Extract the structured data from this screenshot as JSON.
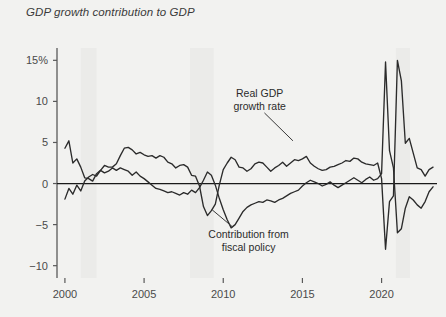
{
  "chart_data": {
    "type": "line",
    "title": "GDP growth contribution to GDP",
    "xlabel": "",
    "ylabel": "",
    "xlim": [
      1999.5,
      2023.5
    ],
    "ylim": [
      -11.5,
      16.5
    ],
    "grid": false,
    "legend_position": "inline-annotations",
    "y_ticks": [
      {
        "value": 15,
        "label": "15%"
      },
      {
        "value": 10,
        "label": "10"
      },
      {
        "value": 5,
        "label": "5"
      },
      {
        "value": 0,
        "label": "0"
      },
      {
        "value": -5,
        "label": "−5"
      },
      {
        "value": -10,
        "label": "−10"
      }
    ],
    "x_ticks": [
      {
        "value": 2000,
        "label": "2000"
      },
      {
        "value": 2005,
        "label": "2005"
      },
      {
        "value": 2010,
        "label": "2010"
      },
      {
        "value": 2015,
        "label": "2015"
      },
      {
        "value": 2020,
        "label": "2020"
      }
    ],
    "annotations": [
      {
        "name": "real-gdp-annotation",
        "line1": "Real GDP",
        "line2": "growth rate",
        "text_x": 2012.3,
        "text_y": 10.5,
        "leader_from": [
          2012.6,
          8.6
        ],
        "leader_to": [
          2014.4,
          5.2
        ]
      },
      {
        "name": "fiscal-policy-annotation",
        "line1": "Contribution from",
        "line2": "fiscal policy",
        "text_x": 2011.6,
        "text_y": -6.6,
        "leader_from": [
          2010.6,
          -5.3
        ],
        "leader_to": [
          2009.3,
          -3.2
        ]
      }
    ],
    "recession_bands": [
      {
        "name": "recession-2001",
        "start": 2001.0,
        "end": 2002.0
      },
      {
        "name": "recession-2008",
        "start": 2007.9,
        "end": 2009.4
      },
      {
        "name": "recession-2020",
        "start": 2020.9,
        "end": 2021.8
      }
    ],
    "band_color": "#ebebe9",
    "zero_line_color": "#1a1a1a",
    "axis_color": "#595959",
    "series": [
      {
        "name": "Real GDP growth rate",
        "color": "#2b2b2b",
        "x": [
          2000.0,
          2000.25,
          2000.5,
          2000.75,
          2001.0,
          2001.25,
          2001.5,
          2001.75,
          2002.0,
          2002.25,
          2002.5,
          2002.75,
          2003.0,
          2003.25,
          2003.5,
          2003.75,
          2004.0,
          2004.25,
          2004.5,
          2004.75,
          2005.0,
          2005.25,
          2005.5,
          2005.75,
          2006.0,
          2006.25,
          2006.5,
          2006.75,
          2007.0,
          2007.25,
          2007.5,
          2007.75,
          2008.0,
          2008.25,
          2008.5,
          2008.75,
          2009.0,
          2009.25,
          2009.5,
          2009.75,
          2010.0,
          2010.25,
          2010.5,
          2010.75,
          2011.0,
          2011.25,
          2011.5,
          2011.75,
          2012.0,
          2012.25,
          2012.5,
          2012.75,
          2013.0,
          2013.25,
          2013.5,
          2013.75,
          2014.0,
          2014.25,
          2014.5,
          2014.75,
          2015.0,
          2015.25,
          2015.5,
          2015.75,
          2016.0,
          2016.25,
          2016.5,
          2016.75,
          2017.0,
          2017.25,
          2017.5,
          2017.75,
          2018.0,
          2018.25,
          2018.5,
          2018.75,
          2019.0,
          2019.25,
          2019.5,
          2019.75,
          2020.0,
          2020.25,
          2020.5,
          2020.75,
          2021.0,
          2021.25,
          2021.5,
          2021.75,
          2022.0,
          2022.25,
          2022.5,
          2022.75,
          2023.0,
          2023.25
        ],
        "values": [
          4.3,
          5.2,
          2.5,
          3.0,
          2.0,
          0.7,
          0.6,
          0.3,
          1.2,
          1.6,
          2.2,
          2.0,
          2.0,
          2.4,
          3.4,
          4.3,
          4.4,
          4.1,
          3.6,
          3.8,
          3.5,
          3.3,
          3.4,
          3.1,
          3.4,
          3.2,
          2.6,
          2.4,
          1.9,
          2.2,
          2.3,
          2.0,
          1.0,
          0.9,
          -0.3,
          -2.8,
          -3.9,
          -3.3,
          -2.5,
          -0.2,
          1.7,
          2.5,
          3.2,
          2.9,
          2.0,
          1.9,
          1.5,
          1.8,
          2.4,
          2.6,
          2.5,
          2.0,
          1.5,
          1.9,
          2.2,
          2.6,
          2.1,
          2.5,
          2.9,
          2.8,
          3.0,
          3.3,
          2.5,
          2.1,
          1.8,
          1.6,
          1.7,
          2.0,
          2.1,
          2.3,
          2.5,
          2.8,
          2.7,
          3.1,
          3.0,
          2.6,
          2.4,
          2.3,
          2.2,
          2.5,
          0.6,
          -8.0,
          -2.2,
          -1.5,
          15.0,
          12.5,
          4.9,
          5.5,
          3.7,
          1.9,
          1.7,
          0.9,
          1.7,
          2.0
        ]
      },
      {
        "name": "Contribution from fiscal policy",
        "color": "#2b2b2b",
        "x": [
          2000.0,
          2000.25,
          2000.5,
          2000.75,
          2001.0,
          2001.25,
          2001.5,
          2001.75,
          2002.0,
          2002.25,
          2002.5,
          2002.75,
          2003.0,
          2003.25,
          2003.5,
          2003.75,
          2004.0,
          2004.25,
          2004.5,
          2004.75,
          2005.0,
          2005.25,
          2005.5,
          2005.75,
          2006.0,
          2006.25,
          2006.5,
          2006.75,
          2007.0,
          2007.25,
          2007.5,
          2007.75,
          2008.0,
          2008.25,
          2008.5,
          2008.75,
          2009.0,
          2009.25,
          2009.5,
          2009.75,
          2010.0,
          2010.25,
          2010.5,
          2010.75,
          2011.0,
          2011.25,
          2011.5,
          2011.75,
          2012.0,
          2012.25,
          2012.5,
          2012.75,
          2013.0,
          2013.25,
          2013.5,
          2013.75,
          2014.0,
          2014.25,
          2014.5,
          2014.75,
          2015.0,
          2015.25,
          2015.5,
          2015.75,
          2016.0,
          2016.25,
          2016.5,
          2016.75,
          2017.0,
          2017.25,
          2017.5,
          2017.75,
          2018.0,
          2018.25,
          2018.5,
          2018.75,
          2019.0,
          2019.25,
          2019.5,
          2019.75,
          2020.0,
          2020.25,
          2020.5,
          2020.75,
          2021.0,
          2021.25,
          2021.5,
          2021.75,
          2022.0,
          2022.25,
          2022.5,
          2022.75,
          2023.0,
          2023.25
        ],
        "values": [
          -1.9,
          -0.6,
          -1.3,
          -0.2,
          -0.9,
          0.3,
          0.8,
          1.1,
          0.9,
          1.6,
          1.3,
          1.5,
          1.9,
          1.6,
          1.9,
          1.7,
          1.5,
          1.0,
          1.4,
          0.9,
          0.6,
          0.2,
          -0.2,
          -0.6,
          -0.7,
          -0.9,
          -1.1,
          -1.0,
          -1.2,
          -1.4,
          -1.1,
          -1.3,
          -0.8,
          -1.1,
          -0.5,
          0.4,
          1.4,
          1.0,
          -0.2,
          -1.8,
          -3.2,
          -4.4,
          -5.4,
          -5.0,
          -4.2,
          -3.4,
          -2.9,
          -2.6,
          -2.4,
          -2.2,
          -2.3,
          -2.0,
          -2.1,
          -2.3,
          -2.0,
          -1.8,
          -1.5,
          -1.2,
          -1.0,
          -0.8,
          -0.3,
          0.1,
          0.4,
          0.2,
          0.0,
          -0.3,
          -0.1,
          0.2,
          -0.2,
          -0.5,
          -0.2,
          0.1,
          0.4,
          0.7,
          0.4,
          0.1,
          0.5,
          0.8,
          0.4,
          0.6,
          1.2,
          14.8,
          4.0,
          1.9,
          -6.0,
          -5.5,
          -3.0,
          -1.6,
          -2.0,
          -2.6,
          -3.0,
          -2.2,
          -1.0,
          -0.4
        ]
      }
    ]
  }
}
